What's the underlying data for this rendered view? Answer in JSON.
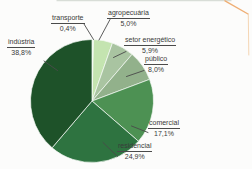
{
  "chart_data": {
    "type": "pie",
    "title": "",
    "unit": "%",
    "direction": "clockwise",
    "start_angle_deg": 0,
    "legend_position": "callout-labels",
    "slices": [
      {
        "label": "transporte",
        "value": 0.4,
        "value_label": "0,4%",
        "color": "#e9f4e2"
      },
      {
        "label": "agropecuária",
        "value": 5.0,
        "value_label": "5,0%",
        "color": "#c4e4b0"
      },
      {
        "label": "setor energético",
        "value": 5.9,
        "value_label": "5,9%",
        "color": "#a9c4a1"
      },
      {
        "label": "público",
        "value": 8.0,
        "value_label": "8,0%",
        "color": "#92b18b"
      },
      {
        "label": "comercial",
        "value": 17.1,
        "value_label": "17,1%",
        "color": "#4d9153"
      },
      {
        "label": "residencial",
        "value": 24.9,
        "value_label": "24,9%",
        "color": "#2e7340"
      },
      {
        "label": "indústria",
        "value": 38.8,
        "value_label": "38,8%",
        "color": "#1e5229"
      }
    ]
  },
  "decor": {
    "background": "#fcfcfb",
    "top_edge_color": "#d8ddd7",
    "corner_fold_color": "#efae74",
    "corner_fold_shadow": "#f5d6b4",
    "leader_line_color": "#4a4a4a",
    "slice_separator_color": "#f7faf6"
  }
}
